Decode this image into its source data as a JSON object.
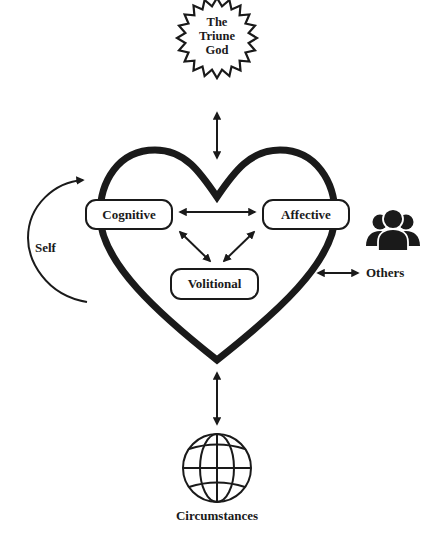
{
  "diagram": {
    "center": {
      "shape": "heart",
      "label": ""
    },
    "top": {
      "label_lines": [
        "The",
        "Triune",
        "God"
      ],
      "shape": "starburst"
    },
    "inner_nodes": {
      "cognitive": "Cognitive",
      "affective": "Affective",
      "volitional": "Volitional"
    },
    "left": {
      "label": "Self",
      "shape": "curved-arrow"
    },
    "right": {
      "label": "Others",
      "icon": "people-group-icon"
    },
    "bottom": {
      "label": "Circumstances",
      "icon": "globe-icon"
    },
    "edges": [
      {
        "from": "The Triune God",
        "to": "Heart",
        "type": "bidirectional"
      },
      {
        "from": "Cognitive",
        "to": "Affective",
        "type": "bidirectional"
      },
      {
        "from": "Cognitive",
        "to": "Volitional",
        "type": "bidirectional"
      },
      {
        "from": "Affective",
        "to": "Volitional",
        "type": "bidirectional"
      },
      {
        "from": "Heart",
        "to": "Others",
        "type": "bidirectional"
      },
      {
        "from": "Heart",
        "to": "Circumstances",
        "type": "bidirectional"
      },
      {
        "from": "Self",
        "to": "Heart",
        "type": "curved-directed"
      }
    ],
    "colors": {
      "stroke": "#1a1a1a",
      "background": "#ffffff"
    }
  }
}
